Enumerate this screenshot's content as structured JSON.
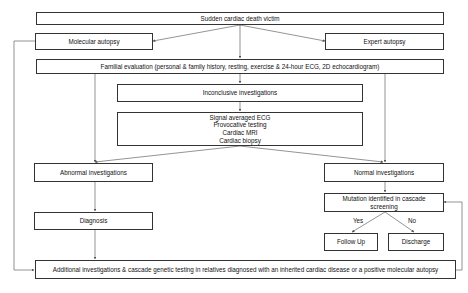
{
  "diagram": {
    "type": "flowchart",
    "nodes": {
      "victim": "Sudden cardiac death victim",
      "molecular_autopsy": "Molecular autopsy",
      "expert_autopsy": "Expert autopsy",
      "familial_evaluation": "Familial evaluation (personal & family history, resting, exercise & 24-hour ECG, 2D echocardiogram)",
      "inconclusive": "Inconclusive investigations",
      "further_tests": [
        "Signal averaged ECG",
        "Provocative testing",
        "Cardiac MRI",
        "Cardiac biopsy"
      ],
      "abnormal": "Abnormal investigations",
      "normal": "Normal investigations",
      "diagnosis": "Diagnosis",
      "mutation": "Mutation identified in cascade screening",
      "follow_up": "Follow Up",
      "discharge": "Discharge",
      "additional": "Additional investigations & cascade genetic testing in relatives diagnosed with an inherited cardiac disease or a positive molecular autopsy"
    },
    "edge_labels": {
      "yes": "Yes",
      "no": "No"
    },
    "colors": {
      "border": "#333333",
      "line": "#555555",
      "background": "#ffffff"
    }
  }
}
